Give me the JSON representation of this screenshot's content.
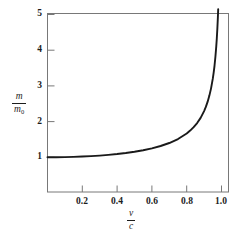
{
  "chart_data": {
    "type": "line",
    "title": "",
    "subtitle": "",
    "xlabel": "v/c",
    "ylabel": "m/m0",
    "xlabel_numerator": "v",
    "xlabel_denominator": "c",
    "ylabel_numerator": "m",
    "ylabel_denominator": "m",
    "ylabel_denominator_sub": "0",
    "xlim": [
      0,
      1.04
    ],
    "ylim": [
      0,
      5.15
    ],
    "grid": false,
    "legend": false,
    "legend_position": "none",
    "x_ticks": [
      0.2,
      0.4,
      0.6,
      0.8,
      1.0
    ],
    "x_tick_labels": [
      "0.2",
      "0.4",
      "0.6",
      "0.8",
      "1.0"
    ],
    "y_ticks": [
      1,
      2,
      3,
      4,
      5
    ],
    "y_tick_labels": [
      "1",
      "2",
      "3",
      "4",
      "5"
    ],
    "line_color": "#1a1a1a",
    "line_width": 1.9,
    "frame_color": "#6d6d6d",
    "background": "#ffffff",
    "series": [
      {
        "name": "relativistic mass factor",
        "formula": "m/m0 = 1 / sqrt(1 - (v/c)^2)",
        "x": [
          0.0,
          0.05,
          0.1,
          0.15,
          0.2,
          0.25,
          0.3,
          0.35,
          0.4,
          0.45,
          0.5,
          0.55,
          0.6,
          0.65,
          0.7,
          0.75,
          0.8,
          0.82,
          0.84,
          0.86,
          0.88,
          0.9,
          0.91,
          0.92,
          0.93,
          0.94,
          0.95,
          0.955,
          0.96,
          0.965,
          0.97,
          0.973,
          0.976,
          0.979,
          0.981
        ],
        "y": [
          1.0,
          1.001,
          1.005,
          1.011,
          1.021,
          1.033,
          1.048,
          1.068,
          1.091,
          1.12,
          1.155,
          1.197,
          1.25,
          1.316,
          1.4,
          1.512,
          1.667,
          1.749,
          1.845,
          1.96,
          2.105,
          2.294,
          2.412,
          2.552,
          2.721,
          2.931,
          3.203,
          3.371,
          3.571,
          3.817,
          4.113,
          4.329,
          4.587,
          4.904,
          5.147
        ]
      }
    ]
  },
  "axes": {
    "x_axis_name": "v over c",
    "y_axis_name": "m over m-naught"
  }
}
